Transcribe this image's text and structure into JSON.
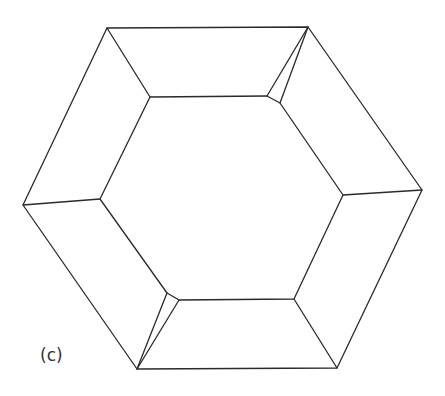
{
  "figure": {
    "label": "(c)",
    "stroke_color": "#2a2a2a",
    "background": "#ffffff"
  },
  "geometry": {
    "outer_hexagon": [
      [
        107,
        28
      ],
      [
        308,
        27
      ],
      [
        422,
        190
      ],
      [
        337,
        368
      ],
      [
        137,
        369
      ],
      [
        23,
        205
      ]
    ],
    "inner_outline": [
      [
        150,
        97
      ],
      [
        267,
        96
      ],
      [
        280,
        103
      ],
      [
        343,
        195
      ],
      [
        294,
        299
      ],
      [
        179,
        300
      ],
      [
        167,
        293
      ],
      [
        100,
        199
      ]
    ],
    "connectors": [
      [
        [
          107,
          28
        ],
        [
          150,
          97
        ]
      ],
      [
        [
          308,
          27
        ],
        [
          267,
          96
        ]
      ],
      [
        [
          308,
          27
        ],
        [
          280,
          103
        ]
      ],
      [
        [
          422,
          190
        ],
        [
          343,
          195
        ]
      ],
      [
        [
          337,
          368
        ],
        [
          294,
          299
        ]
      ],
      [
        [
          137,
          369
        ],
        [
          179,
          300
        ]
      ],
      [
        [
          137,
          369
        ],
        [
          167,
          293
        ]
      ],
      [
        [
          23,
          205
        ],
        [
          100,
          199
        ]
      ]
    ]
  }
}
